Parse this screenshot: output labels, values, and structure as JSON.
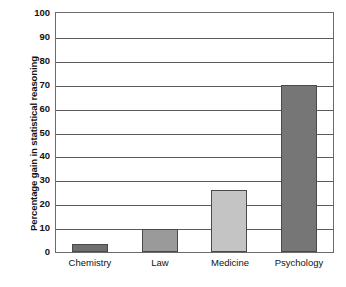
{
  "chart_data": {
    "type": "bar",
    "title": "",
    "subtitle": "",
    "xlabel": "",
    "ylabel": "Percentage gain in statistical reasoning",
    "categories": [
      "Chemistry",
      "Law",
      "Medicine",
      "Psychology"
    ],
    "values": [
      3.5,
      9.5,
      26,
      70
    ],
    "series": [
      {
        "name": "Percentage gain in statistical reasoning",
        "values": [
          3.5,
          9.5,
          26,
          70
        ]
      }
    ],
    "ylim": [
      0,
      100
    ],
    "ytick_labels": [
      "100",
      "90",
      "80",
      "70",
      "60",
      "50",
      "40",
      "30",
      "20",
      "10",
      "0"
    ],
    "ytick_values": [
      100,
      90,
      80,
      70,
      60,
      50,
      40,
      30,
      20,
      10,
      0
    ],
    "grid": true,
    "grid_axis": "y",
    "legend": false,
    "legend_position": "none",
    "annotations": [],
    "bar_colors": [
      "#6e6e6e",
      "#9a9a9a",
      "#c4c4c4",
      "#767676"
    ],
    "bar_border_color": "#4a4a4a",
    "axis_color": "#5a5a5a",
    "background_color": "#ffffff",
    "text_color": "#121212"
  }
}
